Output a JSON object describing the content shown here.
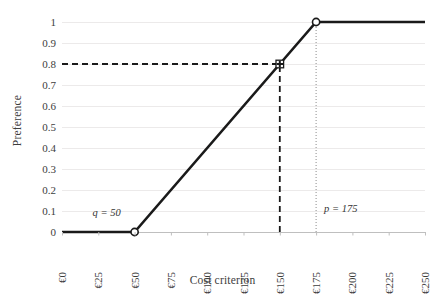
{
  "chart_data": {
    "type": "line",
    "title": "",
    "xlabel": "Cost criterion",
    "ylabel": "Preference",
    "xlim": [
      0,
      250
    ],
    "ylim": [
      0,
      1
    ],
    "grid": true,
    "legend": null,
    "x_tick_labels": [
      "€0",
      "€25",
      "€50",
      "€75",
      "€100",
      "€125",
      "€150",
      "€175",
      "€200",
      "€225",
      "€250"
    ],
    "x_tick_values": [
      0,
      25,
      50,
      75,
      100,
      125,
      150,
      175,
      200,
      225,
      250
    ],
    "y_tick_labels": [
      "0",
      "0.1",
      "0.2",
      "0.3",
      "0.4",
      "0.5",
      "0.6",
      "0.7",
      "0.8",
      "0.9",
      "1"
    ],
    "y_tick_values": [
      0,
      0.1,
      0.2,
      0.3,
      0.4,
      0.5,
      0.6,
      0.7,
      0.8,
      0.9,
      1
    ],
    "series": [
      {
        "name": "preference function",
        "x": [
          0,
          50,
          175,
          250
        ],
        "values": [
          0,
          0,
          1,
          1
        ],
        "style": "solid",
        "color": "#1a1a1a",
        "width": 2.6
      }
    ],
    "markers": [
      {
        "name": "q-threshold-marker",
        "x": 50,
        "y": 0,
        "shape": "open-circle"
      },
      {
        "name": "p-threshold-marker",
        "x": 175,
        "y": 1,
        "shape": "open-circle"
      },
      {
        "name": "evaluated-point-marker",
        "x": 150,
        "y": 0.8,
        "shape": "cross-in-square"
      }
    ],
    "annotations": [
      {
        "name": "q-label",
        "text": "q = 50",
        "x": 50,
        "y": 0.055,
        "align": "right"
      },
      {
        "name": "p-label",
        "text": "p = 175",
        "x": 175,
        "y": 0.075,
        "align": "left"
      }
    ],
    "guides": [
      {
        "name": "preference-value-guide-horizontal",
        "from": [
          0,
          0.8
        ],
        "to": [
          150,
          0.8
        ],
        "style": "dashed",
        "color": "#1a1a1a"
      },
      {
        "name": "preference-value-guide-vertical",
        "from": [
          150,
          0
        ],
        "to": [
          150,
          0.8
        ],
        "style": "dashed",
        "color": "#1a1a1a"
      },
      {
        "name": "p-threshold-guide-vertical",
        "from": [
          175,
          0
        ],
        "to": [
          175,
          1
        ],
        "style": "dotted",
        "color": "#8c8c8c"
      }
    ],
    "colors": {
      "line": "#1a1a1a",
      "grid": "#eceaea",
      "axis": "#bfbfbf",
      "text": "#3d3d3d",
      "background": "#ffffff"
    }
  }
}
